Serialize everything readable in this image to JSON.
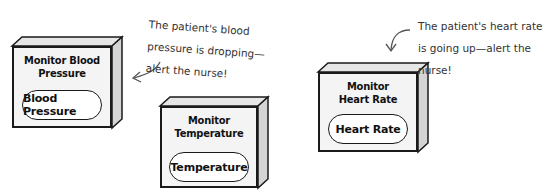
{
  "diagram": {
    "modules": [
      {
        "id": "blood-pressure",
        "title": "Monitor Blood\nPressure",
        "title_line1": "Monitor Blood",
        "title_line2": "Pressure",
        "component": "Blood Pressure"
      },
      {
        "id": "temperature",
        "title_line1": "Monitor",
        "title_line2": "Temperature",
        "component": "Temperature"
      },
      {
        "id": "heart-rate",
        "title_line1": "Monitor",
        "title_line2": "Heart Rate",
        "component": "Heart Rate"
      }
    ],
    "annotations": [
      {
        "target": "blood-pressure",
        "line1": "The patient's blood",
        "line2": "pressure is dropping—",
        "line3": "alert the nurse!"
      },
      {
        "target": "heart-rate",
        "line1": "The patient's heart rate",
        "line2": "is going up—alert the",
        "line3": "nurse!"
      }
    ]
  }
}
